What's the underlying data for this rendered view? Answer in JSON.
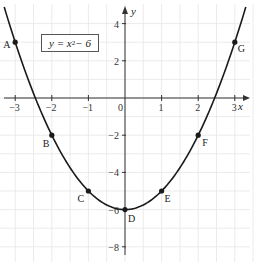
{
  "chart_data": {
    "type": "line",
    "title": "",
    "equation": "y = x² − 6",
    "equation_parts": {
      "lhs": "y = x",
      "exp": "2",
      "rhs": " − 6"
    },
    "xlabel": "x",
    "ylabel": "y",
    "xlim": [
      -3.4,
      3.4
    ],
    "ylim": [
      -8.6,
      4.6
    ],
    "x_ticks": [
      -3,
      -2,
      -1,
      0,
      1,
      2,
      3
    ],
    "x_tick_labels": [
      "−3",
      "−2",
      "−1",
      "0",
      "1",
      "2",
      "3"
    ],
    "y_ticks": [
      4,
      2,
      -2,
      -4,
      -6,
      -8
    ],
    "y_tick_labels": [
      "4",
      "2",
      "−2",
      "−4",
      "−6",
      "−8"
    ],
    "grid": true,
    "series": [
      {
        "name": "y = x² − 6",
        "function": "x^2 - 6",
        "domain": [
          -3.3,
          3.3
        ],
        "color": "#1a1a1a"
      }
    ],
    "points": [
      {
        "label": "A",
        "x": -3,
        "y": 3
      },
      {
        "label": "B",
        "x": -2,
        "y": -2
      },
      {
        "label": "C",
        "x": -1,
        "y": -5
      },
      {
        "label": "D",
        "x": 0,
        "y": -6
      },
      {
        "label": "E",
        "x": 1,
        "y": -5
      },
      {
        "label": "F",
        "x": 2,
        "y": -2
      },
      {
        "label": "G",
        "x": 3,
        "y": 3
      }
    ],
    "colors": {
      "curve": "#1a1a1a",
      "axis": "#333333",
      "grid": "#e6e6e6",
      "text": "#222222"
    }
  }
}
